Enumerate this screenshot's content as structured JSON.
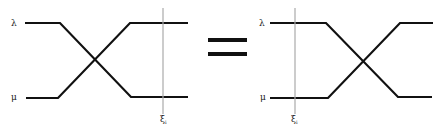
{
  "diagram": {
    "type": "braid-identity",
    "colors": {
      "strand": "#111111",
      "marker": "#aaaaaa",
      "background": "#ffffff"
    },
    "left": {
      "strand_labels": {
        "top": "λ",
        "bottom": "μ"
      },
      "marker_label": "ξ",
      "marker_subscript": "i",
      "marker_position": "right"
    },
    "equals": "=",
    "right": {
      "strand_labels": {
        "top": "λ",
        "bottom": "μ"
      },
      "marker_label": "ξ",
      "marker_subscript": "i",
      "marker_position": "left"
    }
  }
}
